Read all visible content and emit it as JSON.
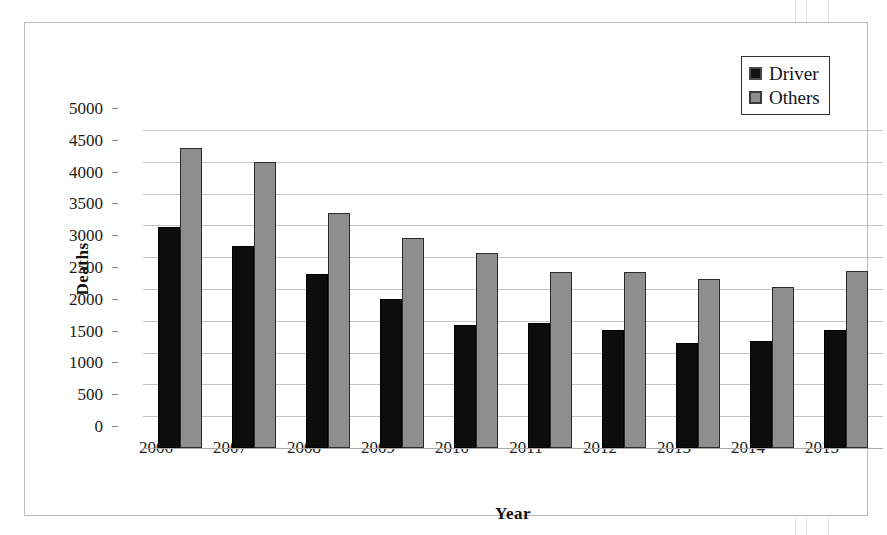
{
  "chart_data": {
    "type": "bar",
    "title": "",
    "xlabel": "Year",
    "ylabel": "Deaths",
    "categories": [
      "2006",
      "2007",
      "2008",
      "2009",
      "2010",
      "2011",
      "2012",
      "2013",
      "2014",
      "2015"
    ],
    "series": [
      {
        "name": "Driver",
        "color": "#0d0d0d",
        "values": [
          3470,
          3180,
          2730,
          2340,
          1940,
          1970,
          1850,
          1650,
          1680,
          1850
        ]
      },
      {
        "name": "Others",
        "color": "#8e8e8e",
        "values": [
          4720,
          4500,
          3700,
          3300,
          3060,
          2770,
          2770,
          2650,
          2530,
          2780
        ]
      }
    ],
    "ylim": [
      0,
      5000
    ],
    "ytick_step": 500,
    "ytick_labels": [
      "5000",
      "4500",
      "4000",
      "3500",
      "3000",
      "2500",
      "2000",
      "1500",
      "1000",
      "500",
      "0"
    ],
    "ytick_values": [
      5000,
      4500,
      4000,
      3500,
      3000,
      2500,
      2000,
      1500,
      1000,
      500,
      0
    ],
    "grid": true,
    "legend_position": "top-right"
  },
  "legend": {
    "entries": [
      {
        "label": "Driver",
        "swatch": "dark-square-swatch"
      },
      {
        "label": "Others",
        "swatch": "gray-square-swatch"
      }
    ]
  }
}
